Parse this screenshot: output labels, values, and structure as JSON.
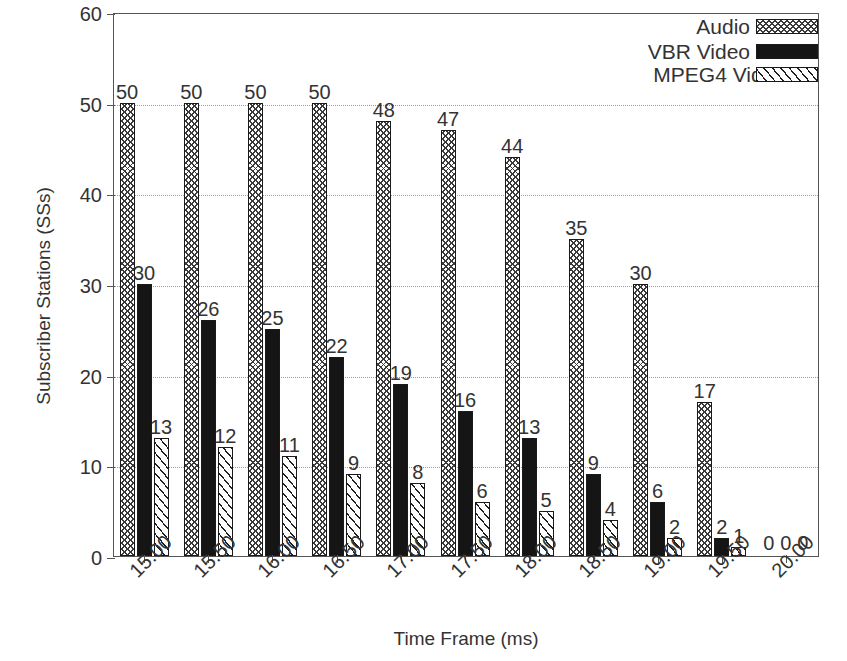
{
  "chart_data": {
    "type": "bar",
    "title": "",
    "xlabel": "Time Frame (ms)",
    "ylabel": "Subscriber Stations (SSs)",
    "categories": [
      "15.00",
      "15.50",
      "16.00",
      "16.50",
      "17.00",
      "17.50",
      "18.00",
      "18.50",
      "19.00",
      "19.50",
      "20.00"
    ],
    "series": [
      {
        "name": "Audio",
        "values": [
          50,
          50,
          50,
          50,
          48,
          47,
          44,
          35,
          30,
          17,
          0
        ]
      },
      {
        "name": "VBR Video",
        "values": [
          30,
          26,
          25,
          22,
          19,
          16,
          13,
          9,
          6,
          2,
          0
        ]
      },
      {
        "name": "MPEG4 Video",
        "values": [
          13,
          12,
          11,
          9,
          8,
          6,
          5,
          4,
          2,
          1,
          0
        ]
      }
    ],
    "ylim": [
      0,
      60
    ],
    "yticks": [
      0,
      10,
      20,
      30,
      40,
      50,
      60
    ],
    "ytick_labels": [
      "0",
      "10",
      "20",
      "30",
      "40",
      "50",
      "60"
    ],
    "grid": true,
    "grid_style": "dotted-horizontal",
    "legend_position": "top-right",
    "data_labels": true,
    "xtick_label_rotation": -45,
    "colors": {
      "audio": "#3a3a3a",
      "vbr_video": "#151515",
      "mpeg4_video": "#1f1f1f",
      "axis": "#555555",
      "grid": "#9a9a9a",
      "background": "#ffffff",
      "text": "#333333"
    },
    "patterns": {
      "audio": "crosshatch",
      "vbr_video": "solid",
      "mpeg4_video": "diagonal-stripes"
    }
  },
  "legend": {
    "items": [
      {
        "label": "Audio",
        "swatch": "crosshatch"
      },
      {
        "label": "VBR Video",
        "swatch": "solid"
      },
      {
        "label": "MPEG4 Video",
        "swatch": "diagonal-stripes"
      }
    ]
  }
}
